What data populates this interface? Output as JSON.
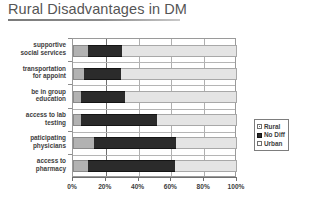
{
  "title": {
    "text": "Rural Disadvantages in DM"
  },
  "chart_data": {
    "type": "bar",
    "orientation": "horizontal",
    "stacked": true,
    "stacked_total": 100,
    "title": "Rural Disadvantages in DM",
    "xlabel": "",
    "ylabel": "",
    "xlim": [
      0,
      100
    ],
    "xticks": [
      0,
      20,
      40,
      60,
      80,
      100
    ],
    "xtick_labels": [
      "0%",
      "20%",
      "40%",
      "60%",
      "80%",
      "100%"
    ],
    "grid": "vertical",
    "legend_position": "right",
    "categories": [
      "supportive social services",
      "transportation for appoint",
      "be in group education",
      "access to lab testing",
      "paticipating physicians",
      "access to pharmacy"
    ],
    "category_lines": [
      [
        "supportive",
        "social services"
      ],
      [
        "transportation",
        "for appoint"
      ],
      [
        "be in group",
        "education"
      ],
      [
        "access to lab",
        "testing"
      ],
      [
        "paticipating",
        "physicians"
      ],
      [
        "access to",
        "pharmacy"
      ]
    ],
    "series": [
      {
        "name": "Rural",
        "color": "#b2b2b2",
        "values": [
          9,
          7,
          5,
          5,
          13,
          9
        ]
      },
      {
        "name": "No Diff",
        "color": "#2b2b2b",
        "values": [
          21,
          22,
          27,
          46,
          50,
          53
        ]
      },
      {
        "name": "Urban",
        "color": "#e4e4e4",
        "values": [
          70,
          71,
          68,
          49,
          37,
          38
        ]
      }
    ],
    "legend": [
      {
        "label": "Rural",
        "swatch": "rural"
      },
      {
        "label": "No Diff",
        "swatch": "nodiff"
      },
      {
        "label": "Urban",
        "swatch": "urban"
      }
    ]
  }
}
